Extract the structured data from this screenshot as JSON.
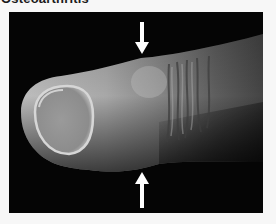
{
  "page": {
    "title": "Osteoarthritis"
  },
  "figure": {
    "annotations": [
      {
        "type": "arrow",
        "direction": "down",
        "position": "top",
        "color": "#ffffff"
      },
      {
        "type": "arrow",
        "direction": "up",
        "position": "bottom",
        "color": "#ffffff"
      }
    ],
    "background_color": "#050505"
  }
}
